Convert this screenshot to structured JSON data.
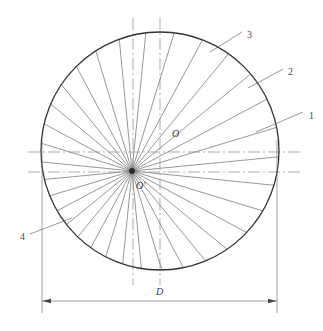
{
  "drawing": {
    "type": "engineering-line-drawing",
    "title_visible": false,
    "background_color": "#ffffff",
    "line_color": "#555555",
    "outline_color": "#333333",
    "centerline_color": "#777777"
  },
  "labels": {
    "callout_1": "1",
    "callout_2": "2",
    "callout_3": "3",
    "callout_4": "4",
    "center_o": "O",
    "center_o_prime": "O'",
    "diameter": "D"
  },
  "geometry": {
    "circle": {
      "cx": 160,
      "cy": 151,
      "r": 119
    },
    "fan_origin": {
      "x": 132,
      "y": 171
    },
    "ray_count": 32,
    "horizontal_centerlines_y": [
      152,
      172
    ],
    "vertical_centerlines_x": [
      133,
      160
    ],
    "dimension_line_y": 301,
    "dimension_extent_x": [
      42,
      277
    ]
  },
  "callout_leaders": [
    {
      "id": "1",
      "text_x": 309,
      "text_y": 110,
      "from_x": 303,
      "from_y": 112,
      "to_x": 256,
      "to_y": 132
    },
    {
      "id": "2",
      "text_x": 288,
      "text_y": 66,
      "from_x": 283,
      "from_y": 69,
      "to_x": 248,
      "to_y": 88
    },
    {
      "id": "3",
      "text_x": 247,
      "text_y": 29,
      "from_x": 242,
      "from_y": 32,
      "to_x": 210,
      "to_y": 52
    },
    {
      "id": "4",
      "text_x": 20,
      "text_y": 231,
      "from_x": 30,
      "from_y": 234,
      "to_x": 72,
      "to_y": 218
    }
  ],
  "chart_data": {
    "type": "scatter",
    "title": "",
    "xlabel": "",
    "ylabel": "",
    "annotations": [
      "1",
      "2",
      "3",
      "4",
      "O",
      "O'",
      "D"
    ]
  }
}
